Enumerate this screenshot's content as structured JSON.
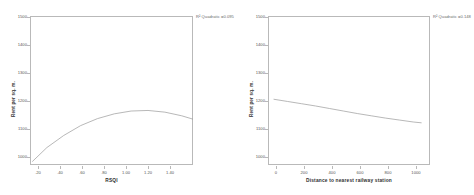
{
  "figure": {
    "background": "#ffffff",
    "frame_color": "#b9b9b9",
    "line_color": "#9a9a9a"
  },
  "chart_data": [
    {
      "type": "line",
      "panel": "left",
      "title": "",
      "xlabel": "RSQI",
      "ylabel": "Rent per sq. m.",
      "annotation": "R² Quadratic =0.095",
      "xlim": [
        0.1,
        1.55
      ],
      "ylim": [
        1000,
        1530
      ],
      "xticks": [
        ".20",
        ".40",
        ".60",
        ".80",
        "1.00",
        "1.20",
        "1.40"
      ],
      "xtick_values": [
        0.2,
        0.4,
        0.6,
        0.8,
        1.0,
        1.2,
        1.4
      ],
      "yticks": [
        "1500",
        "1400",
        "1300",
        "1200",
        "1100",
        "1000"
      ],
      "ytick_values": [
        1500,
        1400,
        1300,
        1200,
        1100,
        1000
      ],
      "grid": false,
      "legend": "none",
      "fit": "quadratic",
      "x": [
        0.12,
        0.25,
        0.4,
        0.55,
        0.7,
        0.85,
        1.0,
        1.15,
        1.3,
        1.45,
        1.55
      ],
      "y": [
        1012,
        1062,
        1105,
        1140,
        1165,
        1182,
        1192,
        1194,
        1188,
        1175,
        1163
      ]
    },
    {
      "type": "line",
      "panel": "right",
      "title": "",
      "xlabel": "Distance to nearest railway station",
      "ylabel": "Rent per sq. m.",
      "annotation": "R² Quadratic =0.148",
      "xlim": [
        -40,
        1120
      ],
      "ylim": [
        1000,
        1530
      ],
      "xticks": [
        "0",
        "200",
        "400",
        "600",
        "800",
        "1000"
      ],
      "xtick_values": [
        0,
        200,
        400,
        600,
        800,
        1000
      ],
      "yticks": [
        "1500",
        "1400",
        "1300",
        "1200",
        "1100",
        "1000"
      ],
      "ytick_values": [
        1500,
        1400,
        1300,
        1200,
        1100,
        1000
      ],
      "grid": false,
      "legend": "none",
      "fit": "quadratic",
      "x": [
        0,
        100,
        200,
        300,
        400,
        500,
        600,
        700,
        800,
        900,
        1000,
        1060
      ],
      "y": [
        1234,
        1226,
        1218,
        1210,
        1201,
        1192,
        1183,
        1175,
        1167,
        1160,
        1153,
        1150
      ]
    }
  ]
}
